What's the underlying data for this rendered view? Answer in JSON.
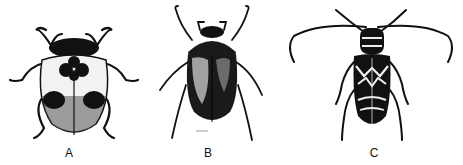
{
  "figures": [
    {
      "label": "A",
      "subject": "ladybird beetle (spotted, rounded body)"
    },
    {
      "label": "B",
      "subject": "scarab / June beetle (glossy dark oval body)"
    },
    {
      "label": "C",
      "subject": "longhorn beetle (banded body, long antennae)"
    }
  ],
  "colors": {
    "ink": "#111111",
    "background": "#ffffff",
    "highlight": "#e8e8e8"
  }
}
